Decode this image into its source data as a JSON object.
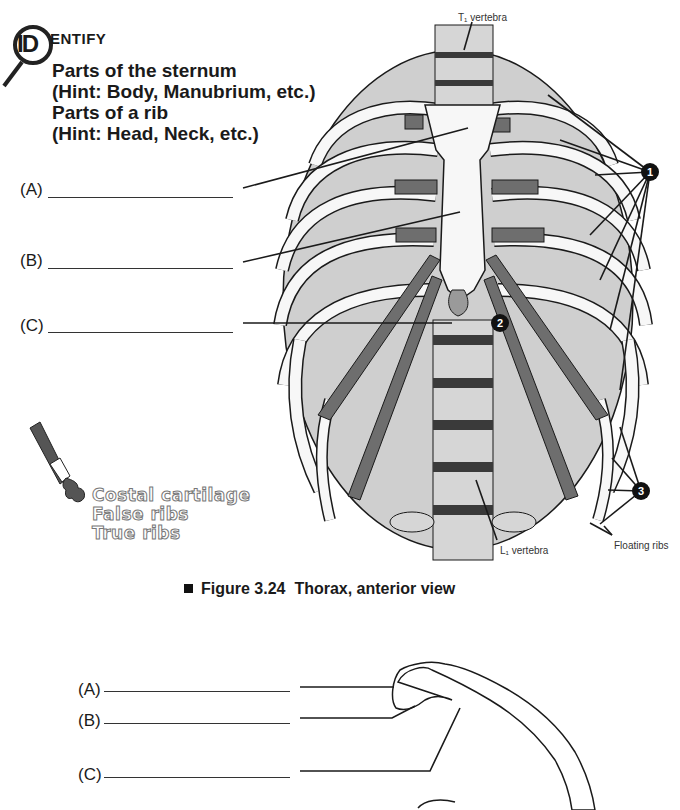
{
  "header": {
    "badge_letters": "ID",
    "title_rest": "ENTIFY",
    "instructions": [
      "Parts of the sternum",
      "(Hint: Body, Manubrium, etc.)",
      "Parts of a rib",
      "(Hint: Head, Neck, etc.)"
    ]
  },
  "sternum_blanks": [
    {
      "label": "(A)",
      "value": ""
    },
    {
      "label": "(B)",
      "value": ""
    },
    {
      "label": "(C)",
      "value": ""
    }
  ],
  "coloring_key": {
    "icon": "paint-tube-icon",
    "items": [
      "Costal cartilage",
      "False ribs",
      "True ribs"
    ]
  },
  "figure": {
    "caption_number": "Figure 3.24",
    "caption_title": "Thorax, anterior view",
    "annotations": {
      "top_vertebra": "T₁ vertebra",
      "bottom_vertebra": "L₁ vertebra",
      "floating_ribs": "Floating ribs"
    },
    "markers": [
      "1",
      "2",
      "3"
    ]
  },
  "rib_blanks": [
    {
      "label": "(A)",
      "value": ""
    },
    {
      "label": "(B)",
      "value": ""
    },
    {
      "label": "(C)",
      "value": ""
    }
  ],
  "colors": {
    "ink": "#1a1a1a",
    "bone": "#f7f7f7",
    "shade": "#bdbdbd",
    "cartilage": "#6e6e6e",
    "disc": "#3a3a3a"
  }
}
